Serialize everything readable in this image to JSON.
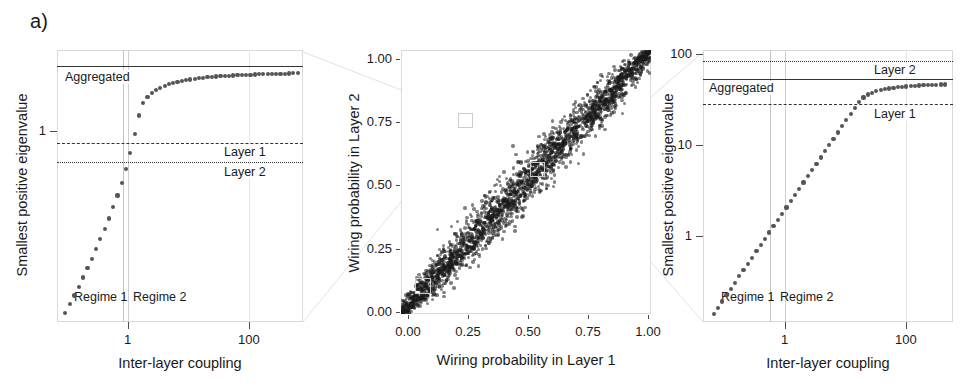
{
  "figure": {
    "panel_label": "a)",
    "background": "#ffffff"
  },
  "panels": {
    "left": {
      "xlabel": "Inter-layer coupling",
      "ylabel": "Smallest positive eigenvalue",
      "x_ticks": [
        "1",
        "100"
      ],
      "y_ticks": [
        "1"
      ],
      "reference_lines": [
        {
          "label": "Aggregated",
          "style": "solid"
        },
        {
          "label": "Layer 1",
          "style": "dashdot"
        },
        {
          "label": "Layer 2",
          "style": "dotted"
        }
      ],
      "regimes": [
        "Regime 1",
        "Regime 2"
      ]
    },
    "middle": {
      "xlabel": "Wiring probability in Layer 1",
      "ylabel": "Wiring probability in Layer 2",
      "x_ticks": [
        "0.00",
        "0.25",
        "0.50",
        "0.75",
        "1.00"
      ],
      "y_ticks": [
        "0.00",
        "0.25",
        "0.50",
        "0.75",
        "1.00"
      ]
    },
    "right": {
      "xlabel": "Inter-layer coupling",
      "ylabel": "Smallest positive eigenvalue",
      "x_ticks": [
        "1",
        "100"
      ],
      "y_ticks": [
        "1",
        "10",
        "100"
      ],
      "reference_lines": [
        {
          "label": "Layer 2",
          "style": "dotted"
        },
        {
          "label": "Aggregated",
          "style": "solid"
        },
        {
          "label": "Layer 1",
          "style": "dashdot"
        }
      ],
      "regimes": [
        "Regime 1",
        "Regime 2"
      ]
    }
  },
  "chart_data": [
    {
      "type": "scatter",
      "id": "left-panel",
      "title": "",
      "xlabel": "Inter-layer coupling",
      "ylabel": "Smallest positive eigenvalue",
      "xscale": "log",
      "yscale": "log",
      "xlim": [
        0.06,
        300
      ],
      "ylim": [
        0.04,
        3.0
      ],
      "grid": true,
      "xticks": [
        1,
        100
      ],
      "yticks": [
        1
      ],
      "hlines": [
        {
          "label": "Aggregated",
          "value": 2.15,
          "style": "solid"
        },
        {
          "label": "Layer 1",
          "value": 0.86,
          "style": "dashdot"
        },
        {
          "label": "Layer 2",
          "value": 0.7,
          "style": "dotted"
        }
      ],
      "vlines": [
        {
          "label": "regime boundary",
          "value": 0.66
        }
      ],
      "annotations": [
        {
          "text": "Regime 1",
          "x": 0.16,
          "y": 0.062
        },
        {
          "text": "Regime 2",
          "x": 0.9,
          "y": 0.062
        }
      ],
      "x": [
        0.08,
        0.095,
        0.11,
        0.128,
        0.148,
        0.172,
        0.2,
        0.232,
        0.269,
        0.312,
        0.362,
        0.42,
        0.487,
        0.565,
        0.655,
        0.76,
        0.882,
        1.023,
        1.187,
        1.377,
        1.597,
        1.853,
        2.15,
        2.494,
        2.894,
        3.357,
        3.895,
        4.518,
        5.242,
        6.081,
        7.055,
        8.185,
        9.496,
        11.02,
        12.78,
        14.83,
        17.2,
        19.96,
        23.15,
        26.86,
        31.16,
        36.15,
        41.93,
        48.64,
        56.43,
        65.46,
        75.94,
        88.1,
        102.2,
        118.6,
        137.6,
        159.6,
        185.1,
        214.8,
        249.2
      ],
      "y": [
        0.046,
        0.053,
        0.061,
        0.07,
        0.081,
        0.094,
        0.109,
        0.127,
        0.149,
        0.175,
        0.207,
        0.247,
        0.298,
        0.364,
        0.454,
        0.585,
        0.79,
        1.06,
        1.3,
        1.43,
        1.52,
        1.59,
        1.65,
        1.7,
        1.74,
        1.775,
        1.805,
        1.832,
        1.856,
        1.878,
        1.897,
        1.914,
        1.929,
        1.943,
        1.956,
        1.967,
        1.977,
        1.986,
        1.995,
        2.002,
        2.009,
        2.016,
        2.022,
        2.028,
        2.033,
        2.038,
        2.043,
        2.047,
        2.051,
        2.055,
        2.059,
        2.062,
        2.066,
        2.069,
        2.072
      ]
    },
    {
      "type": "scatter",
      "id": "middle-panel",
      "title": "",
      "xlabel": "Wiring probability in Layer 1",
      "ylabel": "Wiring probability in Layer 2",
      "xscale": "linear",
      "yscale": "linear",
      "xlim": [
        0.0,
        1.0
      ],
      "ylim": [
        0.0,
        1.0
      ],
      "grid": true,
      "xticks": [
        0.0,
        0.25,
        0.5,
        0.75,
        1.0
      ],
      "yticks": [
        0.0,
        0.25,
        0.5,
        0.75,
        1.0
      ],
      "description": "Dense cloud of points concentrated along the identity diagonal y = x, widening slightly toward the middle and saturating at both ends.",
      "n_points": 2400,
      "highlight_boxes": [
        {
          "x": 0.065,
          "y": 0.063,
          "w": 0.055,
          "h": 0.055
        },
        {
          "x": 0.262,
          "y": 0.7,
          "w": 0.05,
          "h": 0.05
        },
        {
          "x": 0.54,
          "y": 0.518,
          "w": 0.05,
          "h": 0.05
        }
      ]
    },
    {
      "type": "scatter",
      "id": "right-panel",
      "title": "",
      "xlabel": "Inter-layer coupling",
      "ylabel": "Smallest positive eigenvalue",
      "xscale": "log",
      "yscale": "log",
      "xlim": [
        0.08,
        400
      ],
      "ylim": [
        0.28,
        130
      ],
      "grid": true,
      "xticks": [
        1,
        100
      ],
      "yticks": [
        1,
        10,
        100
      ],
      "hlines": [
        {
          "label": "Layer 2",
          "value": 78,
          "style": "dotted"
        },
        {
          "label": "Aggregated",
          "value": 62,
          "style": "solid"
        },
        {
          "label": "Layer 1",
          "value": 33,
          "style": "dashdot"
        }
      ],
      "vlines": [
        {
          "label": "regime boundary",
          "value": 0.66
        }
      ],
      "annotations": [
        {
          "text": "Regime 1",
          "x": 0.17,
          "y": 0.4
        },
        {
          "text": "Regime 2",
          "x": 0.95,
          "y": 0.4
        }
      ],
      "x": [
        0.115,
        0.133,
        0.154,
        0.178,
        0.206,
        0.238,
        0.276,
        0.319,
        0.369,
        0.427,
        0.494,
        0.572,
        0.662,
        0.766,
        0.886,
        1.025,
        1.186,
        1.373,
        1.588,
        1.838,
        2.127,
        2.461,
        2.848,
        3.295,
        3.813,
        4.412,
        5.105,
        5.907,
        6.834,
        7.908,
        9.15,
        10.59,
        12.25,
        14.17,
        16.4,
        18.98,
        21.96,
        25.41,
        29.4,
        34.02,
        39.36,
        45.54,
        52.7,
        60.97,
        70.55,
        81.63,
        94.45,
        109.3,
        126.4,
        146.3,
        169.3,
        195.9,
        226.6,
        262.2,
        303.4
      ],
      "y": [
        0.335,
        0.385,
        0.445,
        0.512,
        0.59,
        0.68,
        0.784,
        0.903,
        1.04,
        1.198,
        1.38,
        1.59,
        1.832,
        2.11,
        2.43,
        2.8,
        3.225,
        3.715,
        4.28,
        4.93,
        5.68,
        6.54,
        7.53,
        8.67,
        9.98,
        11.49,
        13.22,
        15.22,
        17.52,
        20.16,
        23.2,
        26.7,
        30.7,
        35.3,
        40.3,
        44.5,
        47.5,
        49.6,
        51.2,
        52.5,
        53.6,
        54.5,
        55.3,
        56.0,
        56.6,
        57.1,
        57.55,
        57.95,
        58.3,
        58.6,
        58.88,
        59.12,
        59.34,
        59.54,
        59.72
      ]
    }
  ]
}
